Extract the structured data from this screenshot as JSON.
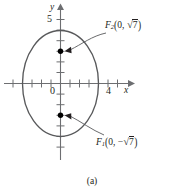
{
  "figure": {
    "caption": "(a)",
    "axes": {
      "x_label": "x",
      "y_label": "y",
      "origin_label": "0",
      "x_tick_label": "4",
      "y_tick_label": "5"
    },
    "curve": {
      "type": "ellipse",
      "center": [
        0,
        0
      ],
      "semi_axis_x": 4,
      "semi_axis_y": 5,
      "stroke": "#58595b"
    },
    "foci": [
      {
        "id": "F2",
        "name": "F",
        "subscript": "2",
        "sign": "",
        "x_value": "0",
        "radical_symbol": "√",
        "radicand": "7",
        "label_text": "F₂(0, √7)",
        "point": [
          0,
          2.6458
        ]
      },
      {
        "id": "F1",
        "name": "F",
        "subscript": "1",
        "sign": "−",
        "x_value": "0",
        "radical_symbol": "√",
        "radicand": "7",
        "label_text": "F₁(0, −√7)",
        "point": [
          0,
          -2.6458
        ]
      }
    ],
    "colors": {
      "ink": "#231f20",
      "curve": "#58595b",
      "axis": "#6d6e71",
      "point": "#000000"
    }
  }
}
